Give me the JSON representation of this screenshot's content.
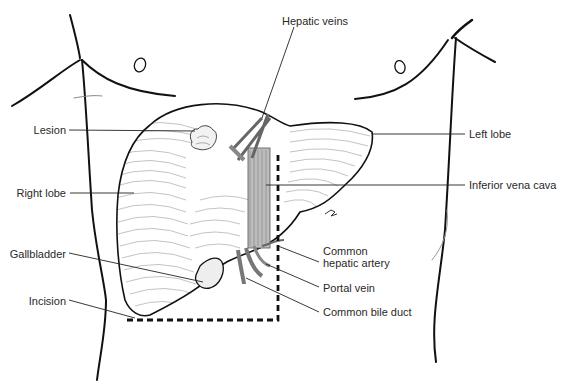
{
  "diagram": {
    "labels": {
      "hepatic_veins": "Hepatic veins",
      "lesion": "Lesion",
      "left_lobe": "Left lobe",
      "right_lobe": "Right lobe",
      "inferior_vena_cava": "Inferior vena cava",
      "gallbladder": "Gallbladder",
      "common_hepatic_artery_line1": "Common",
      "common_hepatic_artery_line2": "hepatic artery",
      "portal_vein": "Portal vein",
      "incision": "Incision",
      "common_bile_duct": "Common bile duct"
    },
    "colors": {
      "ink": "#111111",
      "hatch": "#8a8a8a",
      "label_text": "#2a2a2a",
      "background": "#ffffff"
    }
  }
}
